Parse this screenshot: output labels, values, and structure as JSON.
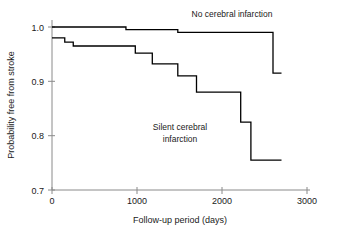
{
  "chart_data": {
    "type": "line",
    "title": "",
    "subtitle": "",
    "xlabel": "Follow-up period (days)",
    "ylabel": "Probability free from stroke",
    "xlim": [
      0,
      3000
    ],
    "ylim": [
      0.7,
      1.0
    ],
    "xticks": [
      0,
      1000,
      2000,
      3000
    ],
    "xtick_labels": [
      "0",
      "1000",
      "2000",
      "3000"
    ],
    "yticks": [
      0.7,
      0.8,
      0.9,
      1.0
    ],
    "ytick_labels": [
      "0.7",
      "0.8",
      "0.9",
      "1.0"
    ],
    "grid": false,
    "legend_position": "inline-annotation",
    "step_type": "post",
    "series": [
      {
        "name": "No cerebral infarction",
        "label_x": 2000,
        "label_y": 1.01,
        "x": [
          0,
          870,
          870,
          1480,
          1480,
          2600,
          2600,
          2700
        ],
        "y": [
          1.0,
          1.0,
          0.995,
          0.995,
          0.99,
          0.99,
          0.915,
          0.915
        ]
      },
      {
        "name": "Silent cerebral infarction",
        "label_x": 1500,
        "label_y": 0.845,
        "x": [
          0,
          150,
          150,
          250,
          250,
          980,
          980,
          1180,
          1180,
          1480,
          1480,
          1700,
          1700,
          2220,
          2220,
          2340,
          2340,
          2700
        ],
        "y": [
          0.98,
          0.98,
          0.972,
          0.972,
          0.965,
          0.965,
          0.952,
          0.952,
          0.932,
          0.932,
          0.91,
          0.91,
          0.88,
          0.88,
          0.825,
          0.825,
          0.755,
          0.755
        ]
      }
    ],
    "annotations": [
      {
        "text": "No cerebral infarction",
        "x": 2000,
        "y": 1.012
      },
      {
        "text": "Silent cerebral",
        "x": 1500,
        "y": 0.858
      },
      {
        "text": "infarction",
        "x": 1500,
        "y": 0.834
      }
    ],
    "colors": {
      "curve": "#000000",
      "axis": "#8a8a8a",
      "text": "#1a1a1a",
      "background": "#ffffff"
    }
  }
}
